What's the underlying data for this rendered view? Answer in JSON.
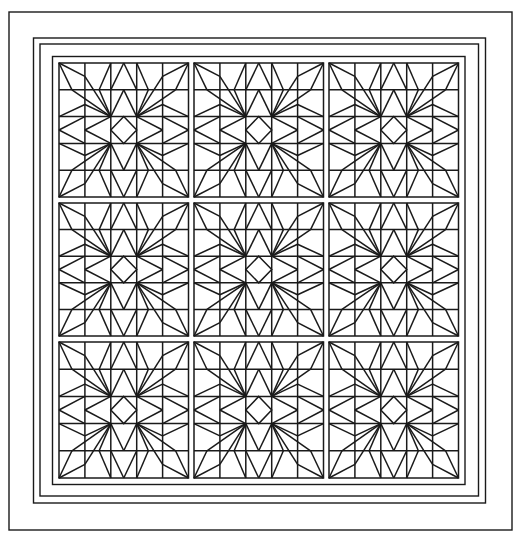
{
  "pattern": {
    "name": "star-block-quilt",
    "rows": 3,
    "cols": 3,
    "block_grid": 5,
    "border_count": 4,
    "line_color": "#1a1a1a",
    "background_color": "#ffffff"
  }
}
